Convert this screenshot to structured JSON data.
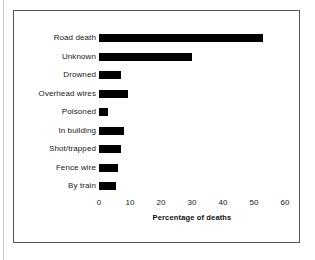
{
  "chart_data": {
    "type": "bar",
    "orientation": "horizontal",
    "title": "",
    "xlabel": "Percentage of deaths",
    "ylabel": "",
    "xlim": [
      0,
      60
    ],
    "xticks": [
      0,
      10,
      20,
      30,
      40,
      50,
      60
    ],
    "xtick_labels": [
      "0",
      "10",
      "20",
      "30",
      "40",
      "50",
      "60"
    ],
    "grid": false,
    "legend": null,
    "bar_color": "#000000",
    "categories": [
      "Road death",
      "Unknown",
      "Drowned",
      "Overhead wires",
      "Poisoned",
      "In building",
      "Shot/trapped",
      "Fence wire",
      "By train"
    ],
    "values": [
      53,
      30,
      7,
      9.5,
      3,
      8,
      7,
      6,
      5.5
    ]
  },
  "figure": {
    "border_color": "#55555a",
    "background": "#ffffff"
  }
}
